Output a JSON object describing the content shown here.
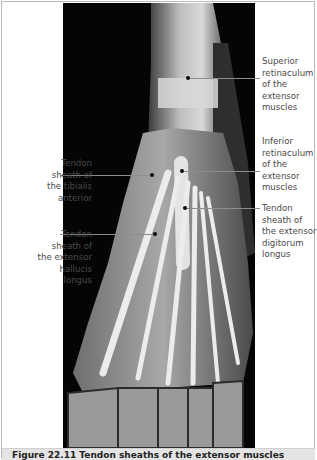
{
  "figure": {
    "labels_right": [
      {
        "text": "Superior retinaculum of the extensor muscles",
        "lines": [
          "Superior",
          "retinaculum",
          "of the",
          "extensor",
          "muscles"
        ]
      },
      {
        "text": "Inferior retinaculum of the extensor muscles",
        "lines": [
          "Inferior",
          "retinaculum",
          "of the",
          "extensor",
          "muscles"
        ]
      },
      {
        "text": "Tendon sheath of the extensor digitorum longus",
        "lines": [
          "Tendon",
          "sheath of",
          "the extensor",
          "digitorum",
          "longus"
        ]
      }
    ],
    "labels_left": [
      {
        "text": "Tendon sheath of the tibialis anterior",
        "lines": [
          "Tendon",
          "sheath of",
          "the tibialis",
          "anterior"
        ]
      },
      {
        "text": "Tendon sheath of the extensor hallucis longus",
        "lines": [
          "Tendon",
          "sheath of",
          "the extensor",
          "hallucis",
          "longus"
        ]
      }
    ],
    "caption": "Figure 22.11 Tendon sheaths of the extensor muscles"
  },
  "colors": {
    "photo_background": "#050505",
    "label_text": "#4a4a4a",
    "leader_line": "#8d8d8d",
    "caption_band": "#e4e4e4"
  }
}
